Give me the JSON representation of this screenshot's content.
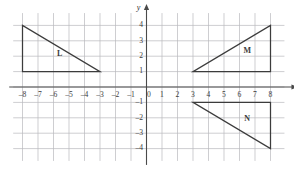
{
  "figure": {
    "title": "",
    "background_color": "#ffffff",
    "grid_color": "#b9b9bd",
    "axis_color": "#4a4a4a",
    "shape_color": "#3c3c3c"
  },
  "axes": {
    "x_axis_name": "x",
    "y_axis_name": "y",
    "x_ticks": [
      -8,
      -7,
      -6,
      -5,
      -4,
      -3,
      -2,
      -1,
      0,
      1,
      2,
      3,
      4,
      5,
      6,
      7,
      8
    ],
    "x_tick_labels": [
      "–8",
      "–7",
      "–6",
      "–5",
      "–4",
      "–3",
      "–2",
      "–1",
      "0",
      "1",
      "2",
      "3",
      "4",
      "5",
      "6",
      "7",
      "8"
    ],
    "y_ticks": [
      4,
      3,
      2,
      1,
      0,
      -1,
      -2,
      -3,
      -4
    ],
    "y_tick_labels": [
      "4",
      "3",
      "2",
      "1",
      "0",
      "–1",
      "–2",
      "–3",
      "–4"
    ],
    "x_range": [
      -8.6,
      8.9
    ],
    "y_range": [
      -4.8,
      4.8
    ],
    "grid": true,
    "grid_step": 1
  },
  "chart_data": {
    "type": "scatter",
    "title": "",
    "xlabel": "x",
    "ylabel": "y",
    "xlim": [
      -8.6,
      8.9
    ],
    "ylim": [
      -4.8,
      4.8
    ],
    "grid": true,
    "legend": "none",
    "shapes": [
      {
        "label": "L",
        "kind": "right-triangle",
        "vertices": [
          [
            -8,
            4
          ],
          [
            -8,
            1
          ],
          [
            -3,
            1
          ]
        ],
        "label_position": [
          -5.6,
          2.1
        ]
      },
      {
        "label": "M",
        "kind": "right-triangle",
        "vertices": [
          [
            3,
            1
          ],
          [
            8,
            1
          ],
          [
            8,
            4
          ]
        ],
        "label_position": [
          6.5,
          2.3
        ]
      },
      {
        "label": "N",
        "kind": "right-triangle",
        "vertices": [
          [
            3,
            -1
          ],
          [
            8,
            -1
          ],
          [
            8,
            -4
          ]
        ],
        "label_position": [
          6.5,
          -2.1
        ]
      }
    ]
  }
}
